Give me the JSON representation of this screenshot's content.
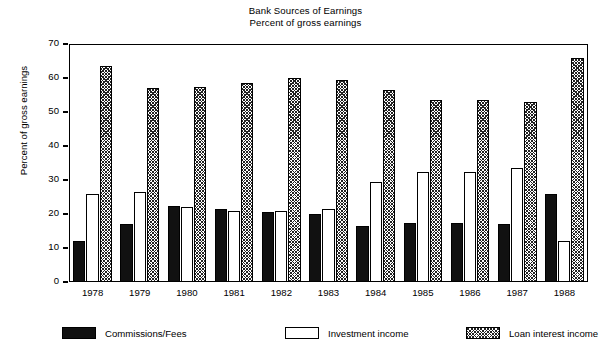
{
  "chart_data": {
    "type": "bar",
    "title": "Bank Sources of Earnings",
    "subtitle": "Percent of gross earnings",
    "xlabel": "",
    "ylabel": "Percent of gross earnings",
    "ylim": [
      0,
      70
    ],
    "yticks": [
      0,
      10,
      20,
      30,
      40,
      50,
      60,
      70
    ],
    "grid": false,
    "legend_position": "bottom",
    "categories": [
      "1978",
      "1979",
      "1980",
      "1981",
      "1982",
      "1983",
      "1984",
      "1985",
      "1986",
      "1987",
      "1988"
    ],
    "series": [
      {
        "name": "Commissions/Fees",
        "fill": "solid-black",
        "color": "#111111",
        "values": [
          12.0,
          17.0,
          22.5,
          21.5,
          20.5,
          20.0,
          16.5,
          17.5,
          17.5,
          17.0,
          26.0
        ]
      },
      {
        "name": "Investment income",
        "fill": "white",
        "color": "#ffffff",
        "values": [
          26.0,
          26.5,
          22.0,
          21.0,
          21.0,
          21.5,
          29.5,
          32.5,
          32.5,
          33.5,
          12.0
        ]
      },
      {
        "name": "Loan interest income",
        "fill": "diagonal-hatch",
        "color": "#222222",
        "values": [
          63.5,
          57.0,
          57.5,
          58.5,
          60.0,
          59.5,
          56.5,
          53.5,
          53.5,
          53.0,
          66.0
        ]
      }
    ]
  }
}
